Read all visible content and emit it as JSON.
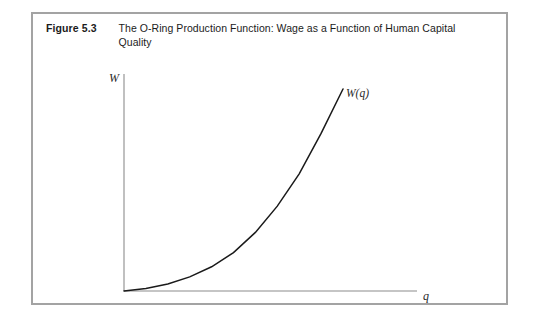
{
  "figure": {
    "number": "Figure 5.3",
    "title": "The O-Ring Production Function: Wage as a Function of Human Capital Quality"
  },
  "chart_data": {
    "type": "line",
    "title": "The O-Ring Production Function: Wage as a Function of Human Capital Quality",
    "xlabel": "q",
    "ylabel": "W",
    "series": [
      {
        "name": "W(q)",
        "annotation": "W(q)",
        "shape": "convex increasing (exponential-like)",
        "x": [
          0.0,
          0.1,
          0.2,
          0.3,
          0.4,
          0.5,
          0.6,
          0.7,
          0.8,
          0.9,
          1.0
        ],
        "y": [
          0.0,
          0.012,
          0.035,
          0.07,
          0.12,
          0.19,
          0.29,
          0.42,
          0.58,
          0.78,
          1.0
        ]
      }
    ],
    "xlim": [
      0,
      1
    ],
    "ylim": [
      0,
      1
    ],
    "grid": false,
    "legend": false,
    "axis_ticks": false,
    "colors": {
      "curve": "#1a1a1a",
      "axis": "#8c8c8c",
      "frame": "#a3a3a3",
      "text": "#1b1b1b"
    }
  }
}
